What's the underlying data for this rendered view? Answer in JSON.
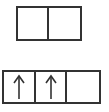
{
  "diagram": {
    "top_row": {
      "cells": [
        {
          "content": ""
        },
        {
          "content": ""
        }
      ]
    },
    "bottom_row": {
      "cells": [
        {
          "content": "up-arrow"
        },
        {
          "content": "up-arrow"
        },
        {
          "content": ""
        }
      ]
    },
    "colors": {
      "stroke": "#333333",
      "background": "#ffffff"
    }
  }
}
